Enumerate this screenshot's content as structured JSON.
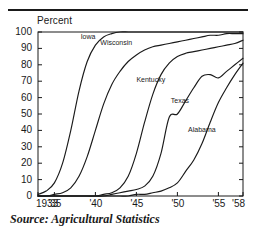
{
  "figure": {
    "source_note": "Source: Agricultural Statistics",
    "rule_color": "#1a1a1a"
  },
  "chart_data": {
    "type": "line",
    "title": "",
    "subtitle": "",
    "xlabel": "",
    "ylabel": "Percent",
    "ylim": [
      0,
      100
    ],
    "xlim": [
      1933,
      1958
    ],
    "yticks": [
      0,
      10,
      20,
      30,
      40,
      50,
      60,
      70,
      80,
      90,
      100
    ],
    "ytick_labels": [
      "0",
      "10",
      "20",
      "30",
      "40",
      "50",
      "60",
      "70",
      "80",
      "90",
      "100"
    ],
    "xticks": [
      1933,
      1935,
      1940,
      1945,
      1950,
      1955,
      1958
    ],
    "xtick_labels": [
      "1933",
      "'35",
      "'40",
      "'45",
      "'50",
      "'55",
      "'58"
    ],
    "grid": false,
    "legend_position": "inline-labels",
    "line_color": "#1a1a1a",
    "x": [
      1933,
      1934,
      1935,
      1936,
      1937,
      1938,
      1939,
      1940,
      1941,
      1942,
      1943,
      1944,
      1945,
      1946,
      1947,
      1948,
      1949,
      1950,
      1951,
      1952,
      1953,
      1954,
      1955,
      1956,
      1957,
      1958
    ],
    "series": [
      {
        "name": "Iowa",
        "label": "Iowa",
        "label_x": 1938.2,
        "label_y": 97.0,
        "values": [
          1,
          3,
          8,
          20,
          40,
          64,
          82,
          92,
          97,
          99,
          100,
          100,
          100,
          100,
          100,
          100,
          100,
          100,
          100,
          100,
          100,
          100,
          100,
          100,
          100,
          100
        ]
      },
      {
        "name": "Wisconsin",
        "label": "Wisconsin",
        "label_x": 1940.6,
        "label_y": 93.0,
        "values": [
          0,
          0,
          1,
          2,
          5,
          12,
          24,
          40,
          56,
          68,
          76,
          82,
          86,
          89,
          91,
          92,
          93,
          94,
          95,
          96,
          97,
          98,
          98,
          99,
          99,
          99
        ]
      },
      {
        "name": "Kentucky",
        "label": "Kentucky",
        "label_x": 1945.0,
        "label_y": 70.5,
        "values": [
          0,
          0,
          0,
          0,
          0,
          0,
          0,
          0,
          1,
          2,
          5,
          12,
          26,
          45,
          62,
          74,
          81,
          85,
          87,
          88,
          89,
          90,
          91,
          92,
          93,
          95
        ]
      },
      {
        "name": "Texas",
        "label": "Texas",
        "label_x": 1949.2,
        "label_y": 58.0,
        "values": [
          0,
          0,
          0,
          0,
          0,
          0,
          0,
          0,
          0,
          1,
          2,
          3,
          4,
          6,
          12,
          26,
          48,
          50,
          58,
          66,
          73,
          74,
          72,
          76,
          80,
          84
        ]
      },
      {
        "name": "Alabama",
        "label": "Alabama",
        "label_x": 1951.3,
        "label_y": 40.0,
        "values": [
          0,
          0,
          0,
          0,
          0,
          0,
          0,
          0,
          0,
          0,
          0,
          0,
          1,
          1,
          2,
          3,
          5,
          8,
          15,
          22,
          32,
          45,
          57,
          66,
          74,
          81
        ]
      }
    ]
  }
}
